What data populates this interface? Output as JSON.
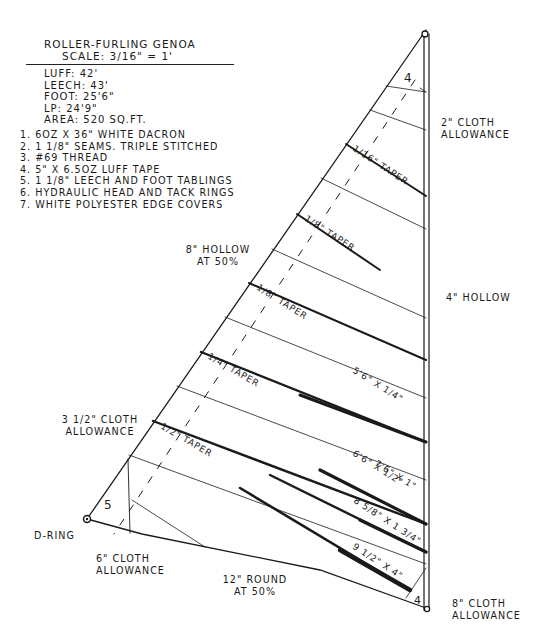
{
  "header": {
    "title": "Roller-Furling Genoa",
    "scale": "Scale: 3/16\" = 1'"
  },
  "specs": [
    {
      "label": "Luff:",
      "value": "42'"
    },
    {
      "label": "Leech:",
      "value": "43'"
    },
    {
      "label": "Foot:",
      "value": "25'6\""
    },
    {
      "label": "LP:",
      "value": "24'9\""
    },
    {
      "label": "Area:",
      "value": "520 sq.ft."
    }
  ],
  "notes": [
    "1. 6oz x 36\" white Dacron",
    "2. 1 1/8\" seams. Triple stitched",
    "3. #69 thread",
    "4. 5\" x 6.5oz luff tape",
    "5. 1 1/8\" leech and foot tablings",
    "6. Hydraulic head and tack rings",
    "7. White polyester edge covers"
  ],
  "annotations": {
    "head_cloth": "2\" cloth allowance",
    "leech_hollow": "8\" hollow at 50%",
    "luff_hollow": "4\" hollow",
    "clew_cloth": "3 1/2\" cloth allowance",
    "d_ring": "D-ring",
    "foot_cloth": "6\" cloth allowance",
    "foot_round": "12\" round at 50%",
    "tack_cloth": "8\" cloth allowance",
    "head_patch_layers": "4",
    "clew_patch_layers": "5",
    "tack_patch_layers": "4"
  },
  "seams": [
    {
      "label": "1/16\" taper"
    },
    {
      "label": "1/8\" taper"
    },
    {
      "label": "1/8\" taper"
    },
    {
      "label": "1/4\" taper"
    },
    {
      "label": "1/2\" taper"
    }
  ],
  "luff_seams": [
    {
      "label": "5'6\" x 1/4\""
    },
    {
      "label": "6'6\" x 1/2\""
    },
    {
      "label": "7'6\" x 1\""
    },
    {
      "label": "8 5/8\" x 1 3/4\""
    },
    {
      "label": "9 1/2\" x 4\""
    }
  ]
}
